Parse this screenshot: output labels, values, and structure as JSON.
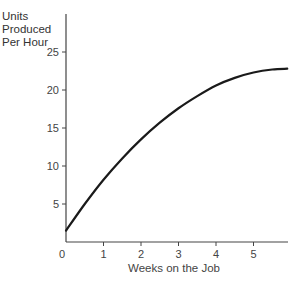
{
  "chart_data": {
    "type": "line",
    "title": "",
    "xlabel": "Weeks on the Job",
    "ylabel": "Units Produced Per Hour",
    "ylabel_lines": [
      "Units",
      "Produced",
      "Per Hour"
    ],
    "x_ticks": [
      "0",
      "1",
      "2",
      "3",
      "4",
      "5"
    ],
    "y_ticks": [
      "5",
      "10",
      "15",
      "20",
      "25"
    ],
    "xlim": [
      0,
      5.9
    ],
    "ylim": [
      0,
      30
    ],
    "grid": false,
    "legend": null,
    "series": [
      {
        "name": "Learning curve",
        "x": [
          0,
          0.5,
          1,
          1.5,
          2,
          2.5,
          3,
          3.5,
          4,
          4.5,
          5,
          5.5,
          5.9
        ],
        "y": [
          1.5,
          5,
          8.2,
          11,
          13.5,
          15.7,
          17.6,
          19.2,
          20.6,
          21.6,
          22.3,
          22.7,
          22.8
        ]
      }
    ]
  }
}
